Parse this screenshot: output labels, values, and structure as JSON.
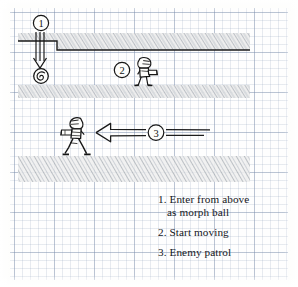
{
  "sketch": {
    "title": "Level design sketch",
    "paper": "graph-paper",
    "colors": {
      "ink": "#14161c",
      "pencil_hatch": "#9aa0a6",
      "grid_minor": "#c3cbd8",
      "grid_major": "#97a4b8",
      "paper": "#fdfdfb"
    }
  },
  "markers": [
    {
      "id": "marker-1",
      "label": "1"
    },
    {
      "id": "marker-2",
      "label": "2"
    },
    {
      "id": "marker-3",
      "label": "3"
    }
  ],
  "annotations": {
    "drop_shaft": {
      "name": "drop-arrow",
      "direction": "down",
      "marker": "1"
    },
    "morph_ball": {
      "name": "morph-ball",
      "marker": "1"
    },
    "player_standing": {
      "name": "player-character-facing-right",
      "marker": "2"
    },
    "player_running": {
      "name": "player-character-running-left",
      "marker": "3"
    },
    "patrol_arrow": {
      "name": "patrol-arrow",
      "direction": "left",
      "marker": "3"
    }
  },
  "legend": {
    "items": [
      {
        "num": "1.",
        "line1": "1. Enter from above",
        "line2": "as morph ball"
      },
      {
        "num": "2.",
        "line1": "2. Start moving",
        "line2": ""
      },
      {
        "num": "3.",
        "line1": "3. Enemy patrol",
        "line2": ""
      }
    ]
  }
}
